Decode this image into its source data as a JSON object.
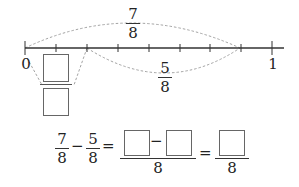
{
  "number_line": {
    "start_label": "0",
    "end_label": "1",
    "divisions": 8,
    "upper_arc": {
      "numerator": "7",
      "denominator": "8",
      "from": 0,
      "to": 7
    },
    "lower_arc": {
      "numerator": "5",
      "denominator": "8",
      "from": 2,
      "to": 7
    },
    "answer_arc": {
      "from": 0,
      "to": 2,
      "numerator_box": "",
      "denominator_box": ""
    }
  },
  "equation": {
    "term1": {
      "numerator": "7",
      "denominator": "8"
    },
    "minus": "−",
    "term2": {
      "numerator": "5",
      "denominator": "8"
    },
    "equals1": "=",
    "combined": {
      "left_box": "",
      "minus": "−",
      "right_box": "",
      "denominator": "8"
    },
    "equals2": "=",
    "result": {
      "box": "",
      "denominator": "8"
    }
  },
  "colors": {
    "line": "#333333",
    "dash": "#999999",
    "box_border": "#666666"
  }
}
